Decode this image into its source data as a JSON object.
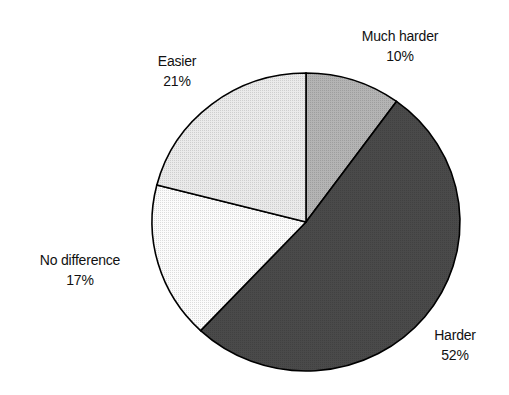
{
  "chart_data": {
    "type": "pie",
    "title": "",
    "start_angle_deg": 0,
    "direction": "clockwise",
    "slices": [
      {
        "label": "Much harder",
        "value": 10,
        "pct_label": "10%",
        "color": "#b4b4b4"
      },
      {
        "label": "Harder",
        "value": 52,
        "pct_label": "52%",
        "color": "#4a4a4a"
      },
      {
        "label": "No difference",
        "value": 17,
        "pct_label": "17%",
        "color": "#fbfbfb"
      },
      {
        "label": "Easier",
        "value": 21,
        "pct_label": "21%",
        "color": "#eaeaea"
      }
    ],
    "legend": "none",
    "labels_outside": true
  }
}
